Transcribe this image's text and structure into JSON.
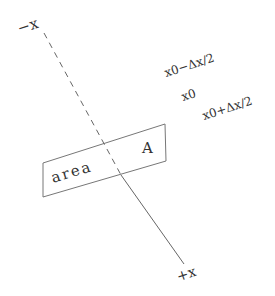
{
  "diagram": {
    "axis": {
      "negative_label": "−x",
      "positive_label": "+x",
      "color": "#555555"
    },
    "positions": {
      "minus_half": "x0−Δx/2",
      "center": "x0",
      "plus_half": "x0+Δx/2"
    },
    "area_box": {
      "label_area": "area",
      "label_A": "A",
      "color": "#777777"
    }
  }
}
